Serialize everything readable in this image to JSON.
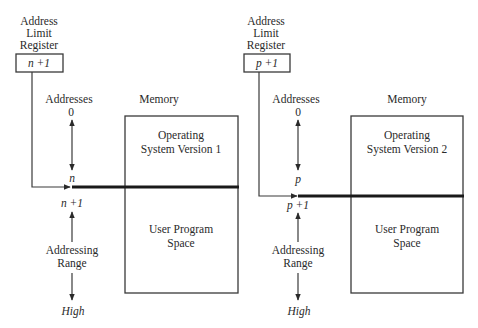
{
  "diagram": {
    "panels": [
      {
        "register": {
          "title_lines": [
            "Address",
            "Limit",
            "Register"
          ],
          "value": "n +1"
        },
        "addresses_label": "Addresses",
        "memory_label": "Memory",
        "start_address": "0",
        "boundary_address": "n",
        "next_address": "n +1",
        "os_label_lines": [
          "Operating",
          "System Version 1"
        ],
        "user_label_lines": [
          "User Program",
          "Space"
        ],
        "range_label_lines": [
          "Addressing",
          "Range"
        ],
        "end_address": "High"
      },
      {
        "register": {
          "title_lines": [
            "Address",
            "Limit",
            "Register"
          ],
          "value": "p +1"
        },
        "addresses_label": "Addresses",
        "memory_label": "Memory",
        "start_address": "0",
        "boundary_address": "p",
        "next_address": "p +1",
        "os_label_lines": [
          "Operating",
          "System Version 2"
        ],
        "user_label_lines": [
          "User Program",
          "Space"
        ],
        "range_label_lines": [
          "Addressing",
          "Range"
        ],
        "end_address": "High"
      }
    ],
    "colors": {
      "line": "#3a3a3a",
      "boundary": "#1a1a1a",
      "text": "#2a2a2a",
      "background": "#ffffff"
    }
  }
}
